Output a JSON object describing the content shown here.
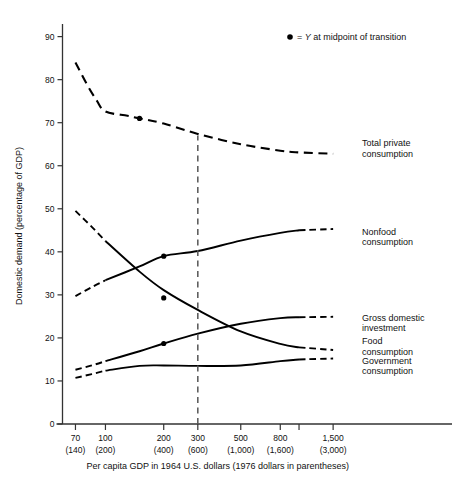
{
  "chart_data": {
    "type": "line",
    "title": "",
    "xlabel": "Per capita GDP in 1964 U.S. dollars (1976 dollars in parentheses)",
    "ylabel": "Domestic demand (percentage of GDP)",
    "xscale": "log",
    "xlim": [
      60,
      1900
    ],
    "ylim": [
      0,
      92
    ],
    "grid": false,
    "legend_position": "top-right",
    "x_ticks": [
      {
        "value": 70,
        "label": "70",
        "paren": "(140)"
      },
      {
        "value": 100,
        "label": "100",
        "paren": "(200)"
      },
      {
        "value": 200,
        "label": "200",
        "paren": "(400)"
      },
      {
        "value": 300,
        "label": "300",
        "paren": "(600)"
      },
      {
        "value": 500,
        "label": "500",
        "paren": "(1,000)"
      },
      {
        "value": 800,
        "label": "800",
        "paren": "(1,600)"
      },
      {
        "value": 1000,
        "label": "",
        "paren": ""
      },
      {
        "value": 1500,
        "label": "1,500",
        "paren": "(3,000)"
      }
    ],
    "y_ticks": [
      {
        "value": 0,
        "label": "0"
      },
      {
        "value": 10,
        "label": "10"
      },
      {
        "value": 20,
        "label": "20"
      },
      {
        "value": 30,
        "label": "30"
      },
      {
        "value": 40,
        "label": "40"
      },
      {
        "value": 50,
        "label": "50"
      },
      {
        "value": 60,
        "label": "60"
      },
      {
        "value": 70,
        "label": "70"
      },
      {
        "value": 80,
        "label": "80"
      },
      {
        "value": 90,
        "label": "90"
      }
    ],
    "legend": [
      {
        "marker": "dot",
        "text_before": "= ",
        "text_italic": "Y",
        "text_after": " at midpoint of transition"
      }
    ],
    "reference_line": {
      "x": 300,
      "style": "dashed",
      "y_from": 0,
      "y_to": 67
    },
    "series": [
      {
        "name": "Total private consumption",
        "label": "Total private\nconsumption",
        "label_lines": [
          "Total private",
          "consumption"
        ],
        "style": "dashed",
        "points": [
          [
            70,
            84.0
          ],
          [
            80,
            79.0
          ],
          [
            90,
            75.2
          ],
          [
            100,
            72.6
          ],
          [
            130,
            71.6
          ],
          [
            150,
            71.0
          ],
          [
            200,
            69.8
          ],
          [
            300,
            67.4
          ],
          [
            500,
            65.0
          ],
          [
            800,
            63.5
          ],
          [
            1000,
            63.1
          ],
          [
            1500,
            62.8
          ]
        ],
        "marker_points": [
          [
            150,
            71.0
          ]
        ],
        "label_anchor": [
          1600,
          64.5
        ]
      },
      {
        "name": "Nonfood consumption",
        "label_lines": [
          "Nonfood",
          "consumption"
        ],
        "style": "solid-with-dashed-ends",
        "dash_start_x": 70,
        "solid_start_x": 100,
        "solid_end_x": 1000,
        "dash_end_x": 1500,
        "points": [
          [
            70,
            29.7
          ],
          [
            85,
            31.8
          ],
          [
            100,
            33.4
          ],
          [
            150,
            36.6
          ],
          [
            200,
            39.0
          ],
          [
            300,
            40.2
          ],
          [
            500,
            42.6
          ],
          [
            800,
            44.4
          ],
          [
            1000,
            45.0
          ],
          [
            1500,
            45.3
          ]
        ],
        "marker_points": [
          [
            200,
            39.0
          ]
        ],
        "label_anchor": [
          1500,
          44.0
        ]
      },
      {
        "name": "Gross domestic investment",
        "label_lines": [
          "Gross domestic",
          "investment"
        ],
        "style": "solid-with-dashed-ends",
        "dash_start_x": 70,
        "solid_start_x": 100,
        "solid_end_x": 1000,
        "dash_end_x": 1500,
        "points": [
          [
            70,
            12.6
          ],
          [
            85,
            13.6
          ],
          [
            100,
            14.6
          ],
          [
            150,
            16.9
          ],
          [
            200,
            18.7
          ],
          [
            300,
            21.0
          ],
          [
            500,
            23.3
          ],
          [
            800,
            24.6
          ],
          [
            1000,
            24.8
          ],
          [
            1500,
            24.9
          ]
        ],
        "marker_points": [
          [
            200,
            18.7
          ]
        ],
        "label_anchor": [
          1550,
          24.0
        ]
      },
      {
        "name": "Food consumption",
        "label_lines": [
          "Food",
          "consumption"
        ],
        "style": "solid-with-dashed-ends",
        "dash_start_x": 70,
        "solid_start_x": 100,
        "solid_end_x": 1000,
        "dash_end_x": 1500,
        "points": [
          [
            70,
            49.5
          ],
          [
            85,
            45.8
          ],
          [
            100,
            42.5
          ],
          [
            150,
            35.4
          ],
          [
            200,
            31.1
          ],
          [
            300,
            26.5
          ],
          [
            500,
            21.5
          ],
          [
            800,
            18.6
          ],
          [
            1000,
            17.8
          ],
          [
            1500,
            17.2
          ]
        ],
        "marker_points": [
          [
            200,
            29.3
          ]
        ],
        "label_anchor": [
          1500,
          18.5
        ]
      },
      {
        "name": "Government consumption",
        "label_lines": [
          "Government",
          "consumption"
        ],
        "style": "solid-with-dashed-ends",
        "dash_start_x": 70,
        "solid_start_x": 100,
        "solid_end_x": 1000,
        "dash_end_x": 1500,
        "points": [
          [
            70,
            10.7
          ],
          [
            85,
            11.6
          ],
          [
            100,
            12.4
          ],
          [
            150,
            13.5
          ],
          [
            200,
            13.6
          ],
          [
            300,
            13.5
          ],
          [
            500,
            13.6
          ],
          [
            800,
            14.6
          ],
          [
            1000,
            15.0
          ],
          [
            1500,
            15.2
          ]
        ],
        "marker_points": [],
        "label_anchor": [
          1500,
          14.0
        ]
      }
    ]
  }
}
